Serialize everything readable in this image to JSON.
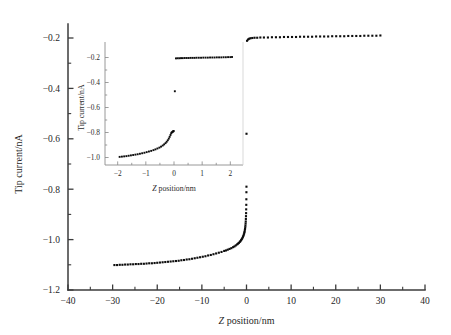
{
  "figure": {
    "background_color": "#ffffff",
    "ink_color": "#0d0d0d",
    "axis_color": "#3b3b3b",
    "inset_axis_color": "#8d8d8d"
  },
  "chart_data": {
    "type": "scatter",
    "title": "",
    "xlabel_prefix": "Z",
    "xlabel_suffix": " position/nm",
    "xlabel": "Z position/nm",
    "ylabel": "Tip current/nA",
    "xlim": [
      -40,
      40
    ],
    "ylim": [
      -1.2,
      -0.2
    ],
    "xticks": [
      -40,
      -30,
      -20,
      -10,
      0,
      10,
      20,
      30,
      40
    ],
    "xtick_labels": [
      "−40",
      "−30",
      "−20",
      "−10",
      "0",
      "10",
      "20",
      "30",
      "40"
    ],
    "yticks": [
      -0.2,
      -0.4,
      -0.6,
      -0.8,
      -1.0,
      -1.2
    ],
    "ytick_labels": [
      "−0.2",
      "−0.4",
      "−0.6",
      "−0.8",
      "−1.0",
      "−1.2"
    ],
    "x_minor_step": 5,
    "y_minor_step": 0.1,
    "grid": false,
    "legend": null,
    "marker": "filled-square",
    "marker_size_px": 2.1,
    "series": [
      {
        "name": "Tip current vs Z position (retract branch)",
        "x": [
          -29.6,
          -29.0,
          -28.4,
          -27.8,
          -27.2,
          -26.6,
          -26.0,
          -25.4,
          -24.8,
          -24.2,
          -23.6,
          -23.0,
          -22.4,
          -21.8,
          -21.2,
          -20.6,
          -20.0,
          -19.4,
          -18.8,
          -18.2,
          -17.6,
          -17.0,
          -16.4,
          -15.8,
          -15.2,
          -14.6,
          -14.0,
          -13.4,
          -12.8,
          -12.2,
          -11.6,
          -11.0,
          -10.4,
          -9.8,
          -9.2,
          -8.6,
          -8.0,
          -7.4,
          -6.8,
          -6.2,
          -5.6,
          -5.0,
          -4.6,
          -4.2,
          -3.8,
          -3.4,
          -3.0,
          -2.7,
          -2.4,
          -2.1,
          -1.9,
          -1.7,
          -1.5,
          -1.35,
          -1.2,
          -1.05,
          -0.92,
          -0.8,
          -0.7,
          -0.6,
          -0.52,
          -0.45,
          -0.39,
          -0.33,
          -0.28,
          -0.24,
          -0.2,
          -0.17,
          -0.14,
          -0.115,
          -0.09,
          -0.07,
          -0.05,
          -0.035,
          -0.02,
          -0.01
        ],
        "y": [
          -1.101,
          -1.101,
          -1.1,
          -1.1,
          -1.099,
          -1.099,
          -1.098,
          -1.098,
          -1.097,
          -1.097,
          -1.096,
          -1.096,
          -1.095,
          -1.094,
          -1.094,
          -1.093,
          -1.092,
          -1.091,
          -1.09,
          -1.089,
          -1.088,
          -1.087,
          -1.086,
          -1.085,
          -1.084,
          -1.082,
          -1.081,
          -1.079,
          -1.078,
          -1.076,
          -1.074,
          -1.072,
          -1.07,
          -1.068,
          -1.066,
          -1.063,
          -1.061,
          -1.058,
          -1.055,
          -1.052,
          -1.049,
          -1.045,
          -1.043,
          -1.04,
          -1.037,
          -1.034,
          -1.03,
          -1.027,
          -1.023,
          -1.019,
          -1.016,
          -1.013,
          -1.009,
          -1.006,
          -1.002,
          -0.998,
          -0.994,
          -0.989,
          -0.985,
          -0.98,
          -0.975,
          -0.97,
          -0.964,
          -0.958,
          -0.951,
          -0.944,
          -0.936,
          -0.928,
          -0.918,
          -0.907,
          -0.895,
          -0.88,
          -0.862,
          -0.84,
          -0.812,
          -0.79
        ],
        "outliers_x": [
          0.0
        ],
        "outliers_y": [
          -0.58
        ]
      },
      {
        "name": "Tip current vs Z position (approach plateau)",
        "x": [
          0.12,
          0.35,
          0.6,
          0.9,
          1.3,
          1.8,
          2.4,
          3.1,
          3.9,
          4.8,
          5.7,
          6.6,
          7.5,
          8.4,
          9.3,
          10.2,
          11.1,
          12.0,
          12.9,
          13.8,
          14.7,
          15.6,
          16.5,
          17.4,
          18.3,
          19.2,
          20.1,
          21.0,
          21.9,
          22.8,
          23.7,
          24.6,
          25.5,
          26.4,
          27.3,
          28.2,
          29.1,
          30.0
        ],
        "y": [
          -0.211,
          -0.206,
          -0.203,
          -0.201,
          -0.2,
          -0.199,
          -0.199,
          -0.198,
          -0.198,
          -0.198,
          -0.197,
          -0.197,
          -0.197,
          -0.196,
          -0.196,
          -0.196,
          -0.196,
          -0.195,
          -0.195,
          -0.195,
          -0.195,
          -0.194,
          -0.194,
          -0.194,
          -0.194,
          -0.193,
          -0.193,
          -0.193,
          -0.193,
          -0.192,
          -0.192,
          -0.192,
          -0.192,
          -0.191,
          -0.191,
          -0.191,
          -0.191,
          -0.19
        ]
      }
    ]
  },
  "inset_chart_data": {
    "type": "scatter",
    "title": "",
    "xlabel_prefix": "Z",
    "xlabel_suffix": " position/nm",
    "xlabel": "Z position/nm",
    "ylabel": "Tip current/nA",
    "xlim": [
      -2.45,
      2.45
    ],
    "ylim": [
      -1.06,
      -0.14
    ],
    "xticks": [
      -2,
      -1,
      0,
      1,
      2
    ],
    "xtick_labels": [
      "−2",
      "−1",
      "0",
      "1",
      "2"
    ],
    "yticks": [
      -0.2,
      -0.4,
      -0.6,
      -0.8,
      -1.0
    ],
    "ytick_labels": [
      "−0.2",
      "−0.4",
      "−0.6",
      "−0.8",
      "−1.0"
    ],
    "grid": false,
    "legend": null,
    "marker": "filled-square",
    "marker_size_px": 1.9,
    "series": [
      {
        "name": "Tip current vs Z position (inset retract branch)",
        "x": [
          -1.93,
          -1.85,
          -1.77,
          -1.69,
          -1.61,
          -1.53,
          -1.45,
          -1.37,
          -1.29,
          -1.21,
          -1.13,
          -1.05,
          -0.97,
          -0.89,
          -0.81,
          -0.73,
          -0.66,
          -0.59,
          -0.52,
          -0.46,
          -0.4,
          -0.35,
          -0.3,
          -0.26,
          -0.22,
          -0.185,
          -0.155,
          -0.125,
          -0.1,
          -0.08,
          -0.06,
          -0.04,
          -0.025,
          -0.012
        ],
        "y": [
          -0.995,
          -0.993,
          -0.991,
          -0.989,
          -0.986,
          -0.983,
          -0.98,
          -0.977,
          -0.974,
          -0.97,
          -0.966,
          -0.962,
          -0.957,
          -0.952,
          -0.947,
          -0.941,
          -0.935,
          -0.928,
          -0.921,
          -0.913,
          -0.904,
          -0.895,
          -0.885,
          -0.874,
          -0.862,
          -0.849,
          -0.835,
          -0.82,
          -0.806,
          -0.8,
          -0.796,
          -0.793,
          -0.79,
          -0.788
        ],
        "outliers_x": [
          0.03
        ],
        "outliers_y": [
          -0.47
        ]
      },
      {
        "name": "Tip current vs Z position (inset approach plateau)",
        "x": [
          0.07,
          0.13,
          0.19,
          0.25,
          0.31,
          0.38,
          0.45,
          0.52,
          0.59,
          0.66,
          0.73,
          0.8,
          0.88,
          0.96,
          1.04,
          1.12,
          1.2,
          1.28,
          1.36,
          1.44,
          1.52,
          1.6,
          1.68,
          1.76,
          1.84,
          1.92,
          2.0,
          2.06
        ],
        "y": [
          -0.207,
          -0.206,
          -0.206,
          -0.205,
          -0.205,
          -0.204,
          -0.204,
          -0.204,
          -0.203,
          -0.203,
          -0.203,
          -0.202,
          -0.202,
          -0.202,
          -0.201,
          -0.201,
          -0.201,
          -0.2,
          -0.2,
          -0.2,
          -0.199,
          -0.199,
          -0.199,
          -0.198,
          -0.198,
          -0.197,
          -0.197,
          -0.196
        ]
      }
    ]
  }
}
